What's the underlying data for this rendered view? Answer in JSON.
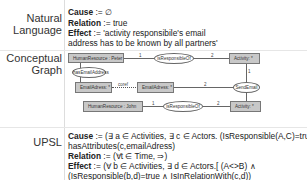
{
  "sections": {
    "natural_language": {
      "label_line1": "Natural",
      "label_line2": "Language",
      "cause_key": "Cause",
      "cause_val": " := ∅",
      "relation_key": "Relation",
      "relation_val": " := true",
      "effect_key": "Effect",
      "effect_val": " := 'activity responsibile's email",
      "effect_val2": "address has to be known by all partners'"
    },
    "conceptual_graph": {
      "label_line1": "Conceptual",
      "label_line2": "Graph",
      "nodes": {
        "hr_peter": "HumanResource : Peter",
        "has_email": "hasEmailAddress",
        "activity1": "Activity: *",
        "is_responsible1": "isResponsibleOf",
        "email1": "EmailAdress: *",
        "email2": "EmailAdress: *",
        "send_email": "SendEmail",
        "hr_john": "HumanResource : John",
        "is_responsible2": "isResponsibleOf",
        "activity2": "Activity: *"
      },
      "multiplicities": {
        "m1": "1",
        "m2": "2",
        "m3": "coref",
        "m4": "2",
        "m5": "1",
        "m6": "1",
        "m7": "2"
      }
    },
    "upsl": {
      "label": "UPSL",
      "cause_key": "Cause",
      "cause_val": " := (∃ a ∈ Activities, ∃ c ∈ Actors. (IsResponsible(A,C)=true ∧",
      "cause_val2": "hasAttributes(c,emailAdress)",
      "relation_key": "Relation",
      "relation_val": " := (∀t ∈ Time, ⇒)",
      "effect_key": "Effect",
      "effect_val": " := (∀ b ∈ Activities, ∃ d ∈ Actors.[ (A<>B) ∧",
      "effect_val2": "(IsResponsible(b,d)=true ∧ IsInRelationWith(c,d))"
    }
  }
}
